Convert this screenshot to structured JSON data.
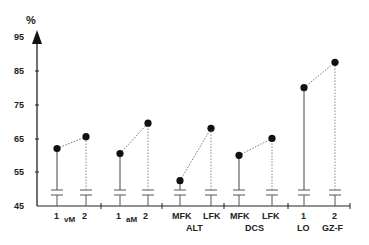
{
  "chart_data": {
    "type": "scatter",
    "title": "",
    "ylabel": "%",
    "xlabel": "",
    "ylim": [
      45,
      95
    ],
    "yticks": [
      45,
      55,
      65,
      75,
      85,
      95
    ],
    "grid": false,
    "legend": null,
    "groups": [
      {
        "name": "vM",
        "points": [
          {
            "label": "1",
            "value": 62
          },
          {
            "label": "2",
            "value": 65.5
          }
        ]
      },
      {
        "name": "aM",
        "points": [
          {
            "label": "1",
            "value": 60.5
          },
          {
            "label": "2",
            "value": 69.5
          }
        ]
      },
      {
        "name": "ALT",
        "points": [
          {
            "label": "MFK",
            "value": 52.5
          },
          {
            "label": "LFK",
            "value": 68
          }
        ]
      },
      {
        "name": "DCS",
        "points": [
          {
            "label": "MFK",
            "value": 60
          },
          {
            "label": "LFK",
            "value": 65
          }
        ]
      },
      {
        "name": "LO / GZ-F",
        "points": [
          {
            "label": "1 LO",
            "value": 80
          },
          {
            "label": "2 GZ-F",
            "value": 87.5
          }
        ]
      }
    ],
    "categories": [
      "1 vM",
      "2 vM",
      "1 aM",
      "2 aM",
      "MFK ALT",
      "LFK ALT",
      "MFK DCS",
      "LFK DCS",
      "1 LO",
      "2 GZ-F"
    ],
    "values": [
      62,
      65.5,
      60.5,
      69.5,
      52.5,
      68,
      60,
      65,
      80,
      87.5
    ],
    "annotations": "Axis break symbols (=) near 50% on each stem; first point of each pair uses solid stem, second uses dotted stem; pairs joined by dotted line"
  },
  "axis": {
    "y_unit": "%",
    "y_tick_labels": [
      "95",
      "85",
      "75",
      "65",
      "55",
      "45"
    ]
  },
  "xlabels": {
    "vM": {
      "p1": "1",
      "group": "vM",
      "p2": "2"
    },
    "aM": {
      "p1": "1",
      "group": "aM",
      "p2": "2"
    },
    "ALT": {
      "p1": "MFK",
      "p2": "LFK",
      "group": "ALT"
    },
    "DCS": {
      "p1": "MFK",
      "p2": "LFK",
      "group": "DCS"
    },
    "LOGZ": {
      "p1": "1",
      "p2": "2",
      "g1": "LO",
      "g2": "GZ-F"
    }
  }
}
